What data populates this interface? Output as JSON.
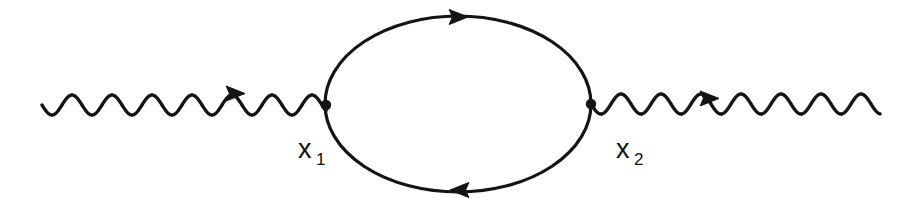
{
  "figure": {
    "kind": "feynman-diagram",
    "name": "photon-self-energy-vacuum-polarization",
    "background_color": "#ffffff",
    "stroke_color": "#141414",
    "width": 917,
    "height": 198
  },
  "chart_data": {
    "type": "diagram",
    "title": "",
    "nodes": [
      {
        "id": "x1",
        "label": "x",
        "subscript": "1",
        "x": 326,
        "y": 105,
        "kind": "vertex-dot"
      },
      {
        "id": "x2",
        "label": "x",
        "subscript": "2",
        "x": 591,
        "y": 104,
        "kind": "vertex-dot"
      }
    ],
    "edges": [
      {
        "id": "photon-in",
        "kind": "wavy",
        "from_x": 42,
        "to_x": 326,
        "y": 105,
        "amplitude": 10,
        "period": 40,
        "arrow_x": 232,
        "arrow_direction": "right"
      },
      {
        "id": "fermion-loop-upper",
        "kind": "solid-arc",
        "center_x": 458,
        "center_y": 104,
        "rx": 133,
        "ry": 88,
        "arrow_x": 455,
        "arrow_y": 17,
        "arrow_direction": "right"
      },
      {
        "id": "fermion-loop-lower",
        "kind": "solid-arc",
        "center_x": 458,
        "center_y": 104,
        "rx": 133,
        "ry": 88,
        "arrow_x": 463,
        "arrow_y": 190,
        "arrow_direction": "left"
      },
      {
        "id": "photon-out",
        "kind": "wavy",
        "from_x": 591,
        "to_x": 880,
        "y": 104,
        "amplitude": 10,
        "period": 40,
        "arrow_x": 706,
        "arrow_direction": "right"
      }
    ],
    "labels": [
      {
        "id": "label-x1",
        "base": "x",
        "sub": "1",
        "x": 298,
        "y": 158
      },
      {
        "id": "label-x2",
        "base": "x",
        "sub": "2",
        "x": 616,
        "y": 158
      }
    ]
  },
  "labels": {
    "x1": {
      "base": "x",
      "sub": "1"
    },
    "x2": {
      "base": "x",
      "sub": "2"
    }
  }
}
